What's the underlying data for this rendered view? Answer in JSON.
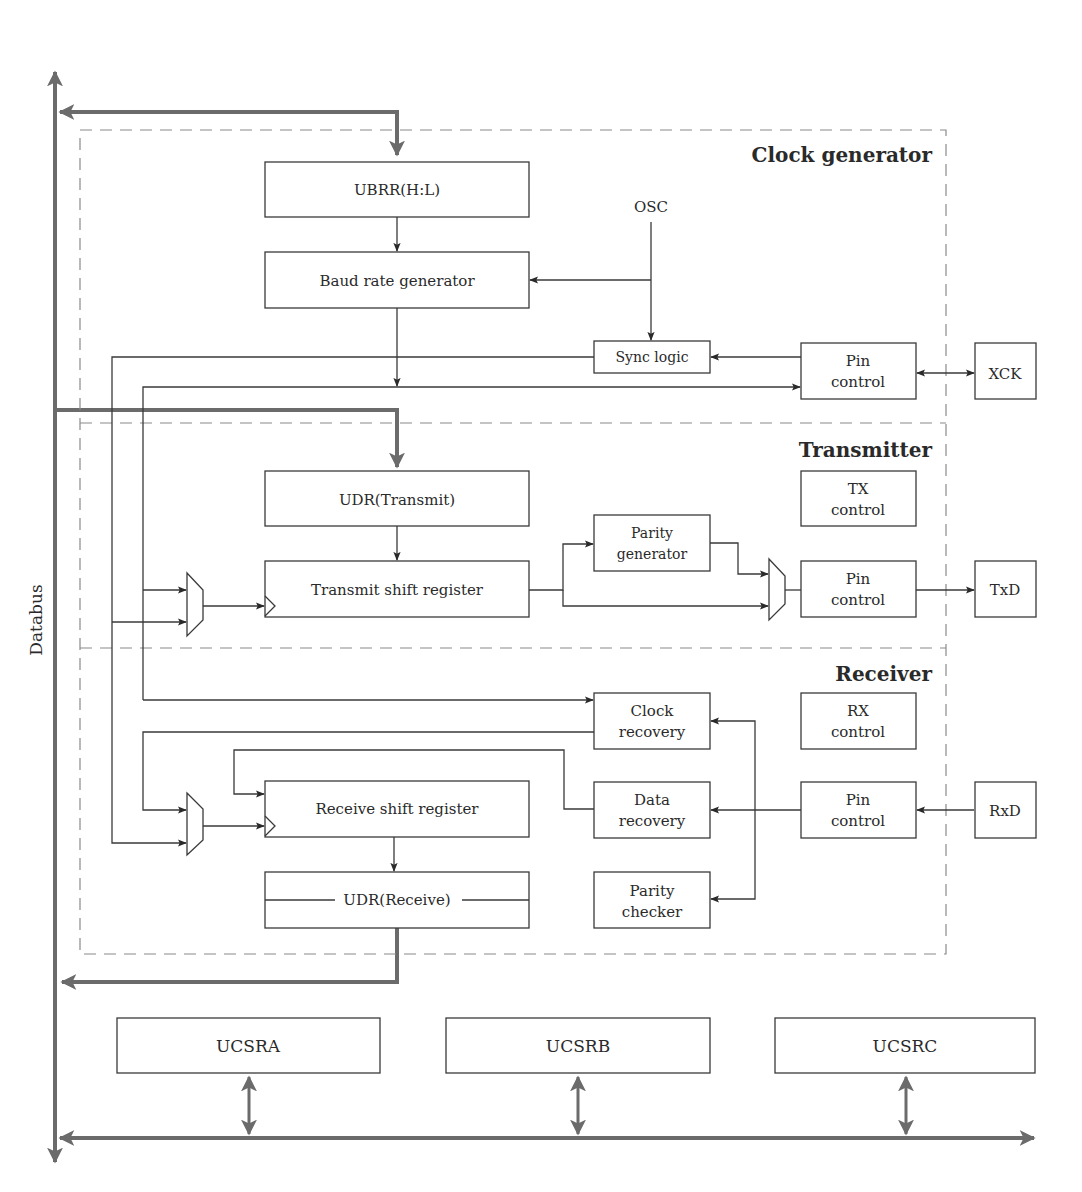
{
  "diagram": {
    "bus_label": "Databus",
    "colors": {
      "bus": "#6b6b6b",
      "line": "#3a3a3a",
      "dashed_border": "#8a8a8a",
      "background": "#ffffff"
    },
    "sections": {
      "clock_generator": {
        "title": "Clock generator",
        "blocks": {
          "ubrr": "UBRR(H:L)",
          "baud": "Baud rate generator",
          "osc": "OSC",
          "sync": "Sync logic",
          "pin_line1": "Pin",
          "pin_line2": "control",
          "xck": "XCK"
        }
      },
      "transmitter": {
        "title": "Transmitter",
        "blocks": {
          "udr_tx": "UDR(Transmit)",
          "tx_shift": "Transmit shift register",
          "parity_gen_line1": "Parity",
          "parity_gen_line2": "generator",
          "tx_control_line1": "TX",
          "tx_control_line2": "control",
          "pin_line1": "Pin",
          "pin_line2": "control",
          "txd": "TxD"
        }
      },
      "receiver": {
        "title": "Receiver",
        "blocks": {
          "clock_rec_line1": "Clock",
          "clock_rec_line2": "recovery",
          "rx_control_line1": "RX",
          "rx_control_line2": "control",
          "rx_shift": "Receive shift register",
          "data_rec_line1": "Data",
          "data_rec_line2": "recovery",
          "pin_line1": "Pin",
          "pin_line2": "control",
          "rxd": "RxD",
          "udr_rx": "UDR(Receive)",
          "parity_chk_line1": "Parity",
          "parity_chk_line2": "checker"
        }
      }
    },
    "status_registers": [
      "UCSRA",
      "UCSRB",
      "UCSRC"
    ]
  }
}
